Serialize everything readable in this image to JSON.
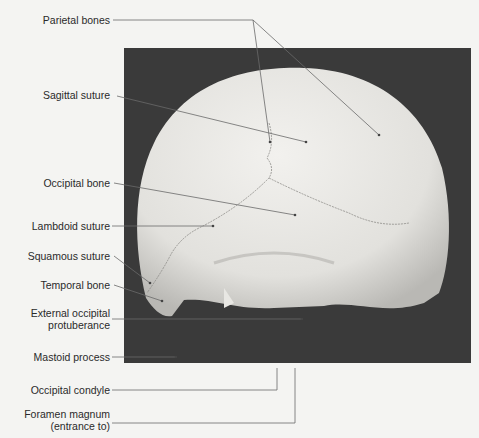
{
  "figure": {
    "labels": [
      {
        "id": "parietal",
        "text": "Parietal bones"
      },
      {
        "id": "sagittal",
        "text": "Sagittal suture"
      },
      {
        "id": "occipital",
        "text": "Occipital bone"
      },
      {
        "id": "lambdoid",
        "text": "Lambdoid suture"
      },
      {
        "id": "squamous",
        "text": "Squamous suture"
      },
      {
        "id": "temporal",
        "text": "Temporal bone"
      },
      {
        "id": "eop1",
        "text": "External occipital"
      },
      {
        "id": "eop2",
        "text": "protuberance"
      },
      {
        "id": "mastoid",
        "text": "Mastoid process"
      },
      {
        "id": "condyle",
        "text": "Occipital condyle"
      },
      {
        "id": "foramen1",
        "text": "Foramen magnum"
      },
      {
        "id": "foramen2",
        "text": "(entrance to)"
      }
    ]
  }
}
